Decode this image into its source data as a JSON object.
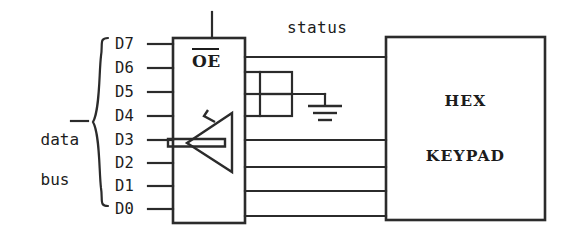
{
  "diagram": {
    "bus_label_line1": "data",
    "bus_label_line2": "bus",
    "pins": [
      {
        "name": "D7"
      },
      {
        "name": "D6"
      },
      {
        "name": "D5"
      },
      {
        "name": "D4"
      },
      {
        "name": "D3"
      },
      {
        "name": "D2"
      },
      {
        "name": "D1"
      },
      {
        "name": "D0"
      }
    ],
    "buffer": {
      "enable_label": "OE",
      "enable_active_low": true
    },
    "status_label": "status",
    "keypad": {
      "line1": "HEX",
      "line2": "KEYPAD"
    },
    "colors": {
      "ink": "#2b2b2b",
      "background": "#ffffff"
    }
  }
}
